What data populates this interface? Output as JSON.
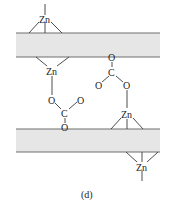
{
  "diagram": {
    "caption": "(d)",
    "layers": [
      {
        "id": "top-layer",
        "x": 16,
        "y": 33,
        "width": 144,
        "height": 24
      },
      {
        "id": "bottom-layer",
        "x": 16,
        "y": 129,
        "width": 144,
        "height": 23
      }
    ],
    "atoms": {
      "zn_top_outer": "Zn",
      "zn_top_inner": "Zn",
      "zn_bottom_inner": "Zn",
      "zn_bottom_outer": "Zn",
      "carbonate_left_o1": "O",
      "carbonate_left_o2": "O",
      "carbonate_left_c": "C",
      "carbonate_left_o3": "O",
      "carbonate_right_o1": "O",
      "carbonate_right_c": "C",
      "carbonate_right_o2": "O",
      "carbonate_right_o3": "O"
    },
    "colors": {
      "layer_fill": "#e6e6e6",
      "layer_edge": "#6e6e6e",
      "bond": "#3a3a3a",
      "text": "#222222"
    }
  }
}
